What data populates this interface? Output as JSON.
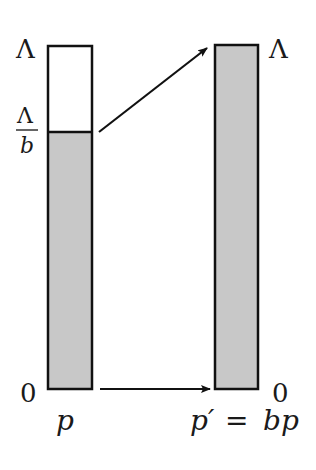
{
  "diagram": {
    "left_bar": {
      "label_bottom": "p",
      "tick_top": "Λ",
      "tick_fraction_num": "Λ",
      "tick_fraction_den": "b",
      "tick_zero": "0",
      "fill_color": "#c8c8c8",
      "empty_color": "#ffffff"
    },
    "right_bar": {
      "label_bottom_lhs": "p′",
      "label_bottom_eq": "=",
      "label_bottom_rhs": "bp",
      "tick_top": "Λ",
      "tick_zero": "0",
      "fill_color": "#c8c8c8"
    },
    "arrows": [
      {
        "name": "scale-arrow-top",
        "from": "Λ/b",
        "to": "Λ"
      },
      {
        "name": "scale-arrow-bottom",
        "from": "0",
        "to": "0"
      }
    ],
    "stroke_color": "#111111"
  }
}
